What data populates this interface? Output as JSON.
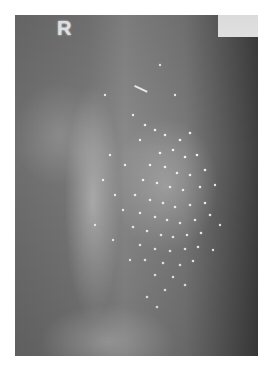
{
  "image": {
    "description": "Abdominal radiograph showing numerous radiopaque pellets scattered over the left abdomen",
    "marker": "R",
    "label_box_text": "",
    "colors": {
      "background": "#ffffff",
      "film_dark": "#3f3f3f",
      "film_mid": "#7a7a7a",
      "pellet": "#f2f2f2"
    }
  }
}
